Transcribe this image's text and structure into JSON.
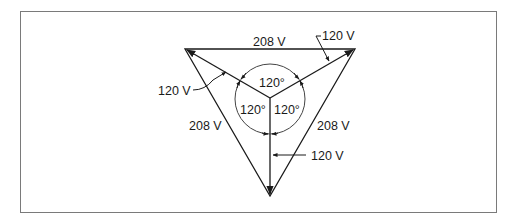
{
  "diagram": {
    "type": "three-phase wye voltage diagram",
    "colors": {
      "line": "#1a1a1a",
      "frame": "#7a7a7a",
      "background": "#ffffff"
    },
    "line_voltages": {
      "top": "208 V",
      "left": "208 V",
      "right": "208 V"
    },
    "phase_voltages": {
      "upper_right": "120 V",
      "left": "120 V",
      "bottom": "120 V"
    },
    "angles": {
      "top": "120°",
      "left": "120°",
      "right": "120°"
    }
  }
}
